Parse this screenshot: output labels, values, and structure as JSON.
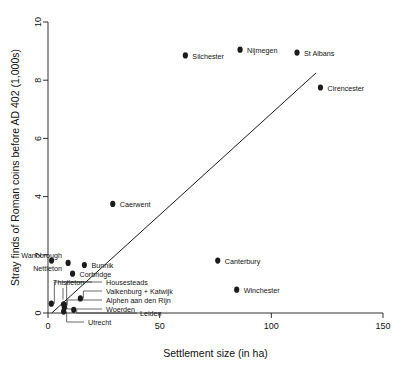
{
  "chart_data": {
    "type": "scatter",
    "title": "",
    "xlabel": "Settlement size (in ha)",
    "ylabel": "Stray finds of Roman coins before AD 402 (1,000s)",
    "xlim": [
      0,
      150
    ],
    "ylim": [
      0,
      10
    ],
    "xticks": [
      0,
      50,
      100,
      150
    ],
    "yticks": [
      0,
      2,
      4,
      6,
      8,
      10
    ],
    "grid": false,
    "legend": "none",
    "marker_color": "#1b1b1b",
    "line_color": "#1a1a1a",
    "points": [
      {
        "label": "Silchester",
        "x": 61.5,
        "y": 8.85
      },
      {
        "label": "Nijmegen",
        "x": 86.0,
        "y": 9.05
      },
      {
        "label": "St Albans",
        "x": 111.5,
        "y": 8.95
      },
      {
        "label": "Cirencester",
        "x": 122.0,
        "y": 7.75
      },
      {
        "label": "Caerwent",
        "x": 29.0,
        "y": 3.75
      },
      {
        "label": "Canterbury",
        "x": 76.0,
        "y": 1.8
      },
      {
        "label": "Winchester",
        "x": 84.5,
        "y": 0.8
      },
      {
        "label": "Bunnik",
        "x": 16.3,
        "y": 1.65
      },
      {
        "label": "Corbridge",
        "x": 11.0,
        "y": 1.35
      },
      {
        "label": "Wanborough",
        "x": 9.0,
        "y": 1.72
      },
      {
        "label": "Nettleton",
        "x": 1.6,
        "y": 1.8
      },
      {
        "label": "Thistleton",
        "x": 1.5,
        "y": 0.32
      },
      {
        "label": "Housesteads",
        "x": 7.0,
        "y": 0.3
      },
      {
        "label": "Valkenburg + Katwijk",
        "x": 14.5,
        "y": 0.5
      },
      {
        "label": "Alphen aan den Rijn",
        "x": 7.3,
        "y": 0.26
      },
      {
        "label": "Woerden",
        "x": 7.3,
        "y": 0.18
      },
      {
        "label": "Leiden",
        "x": 11.5,
        "y": 0.11
      },
      {
        "label": "Utrecht",
        "x": 7.0,
        "y": 0.05
      }
    ],
    "fit_line": {
      "x0": 1.7,
      "y0": 0.0,
      "x1": 120.0,
      "y1": 8.25
    }
  }
}
